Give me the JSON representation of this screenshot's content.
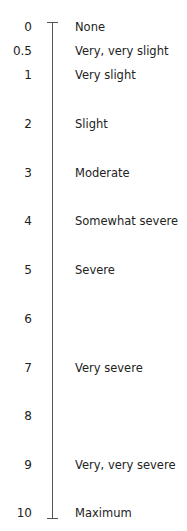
{
  "scale": {
    "items": [
      {
        "value": "0",
        "label": "None",
        "y": 27
      },
      {
        "value": "0.5",
        "label": "Very, very slight",
        "y": 51
      },
      {
        "value": "1",
        "label": "Very slight",
        "y": 75
      },
      {
        "value": "2",
        "label": "Slight",
        "y": 124
      },
      {
        "value": "3",
        "label": "Moderate",
        "y": 173
      },
      {
        "value": "4",
        "label": "Somewhat severe",
        "y": 221
      },
      {
        "value": "5",
        "label": "Severe",
        "y": 270
      },
      {
        "value": "6",
        "label": "",
        "y": 319
      },
      {
        "value": "7",
        "label": "Very severe",
        "y": 368
      },
      {
        "value": "8",
        "label": "",
        "y": 416
      },
      {
        "value": "9",
        "label": "Very, very severe",
        "y": 465
      },
      {
        "value": "10",
        "label": "Maximum",
        "y": 513
      }
    ]
  }
}
